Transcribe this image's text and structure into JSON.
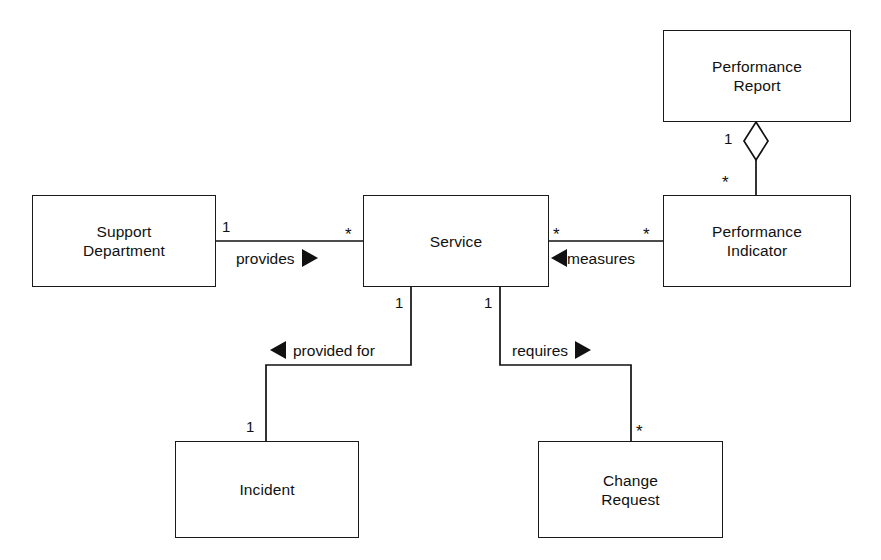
{
  "diagram": {
    "type": "uml-class-diagram",
    "background_color": "#ffffff",
    "line_color": "#111111",
    "classes": [
      {
        "id": "performance-report",
        "name": "Performance\nReport",
        "x": 663,
        "y": 30,
        "width": 188,
        "height": 92
      },
      {
        "id": "support-department",
        "name": "Support\nDepartment",
        "x": 32,
        "y": 195,
        "width": 184,
        "height": 92
      },
      {
        "id": "service",
        "name": "Service",
        "x": 363,
        "y": 195,
        "width": 186,
        "height": 92
      },
      {
        "id": "performance-indicator",
        "name": "Performance\nIndicator",
        "x": 663,
        "y": 195,
        "width": 188,
        "height": 92
      },
      {
        "id": "incident",
        "name": "Incident",
        "x": 175,
        "y": 441,
        "width": 184,
        "height": 97
      },
      {
        "id": "change-request",
        "name": "Change\nRequest",
        "x": 538,
        "y": 441,
        "width": 185,
        "height": 97
      }
    ],
    "associations": [
      {
        "id": "provides",
        "label": "provides",
        "arrow": "right",
        "from": "support-department",
        "to": "service",
        "source_multiplicity": "1",
        "target_multiplicity": "*"
      },
      {
        "id": "measures",
        "label": "measures",
        "arrow": "left",
        "from": "performance-indicator",
        "to": "service",
        "source_multiplicity": "*",
        "target_multiplicity": "*"
      },
      {
        "id": "provided-for",
        "label": "provided for",
        "arrow": "left",
        "from": "incident",
        "to": "service",
        "source_multiplicity": "1",
        "target_multiplicity": "1"
      },
      {
        "id": "requires",
        "label": "requires",
        "arrow": "right",
        "from": "service",
        "to": "change-request",
        "source_multiplicity": "1",
        "target_multiplicity": "*"
      },
      {
        "id": "report-aggregation",
        "label": "",
        "arrow": "aggregation-diamond",
        "from": "performance-report",
        "to": "performance-indicator",
        "source_multiplicity": "1",
        "target_multiplicity": "*"
      }
    ],
    "multiplicity_labels": {
      "provides_source": "1",
      "provides_target": "*",
      "measures_service_side": "*",
      "measures_indicator_side": "*",
      "provided_for_service_side": "1",
      "provided_for_incident_side": "1",
      "requires_service_side": "1",
      "requires_change_side": "*",
      "aggregation_report_side": "1",
      "aggregation_indicator_side": "*"
    }
  }
}
